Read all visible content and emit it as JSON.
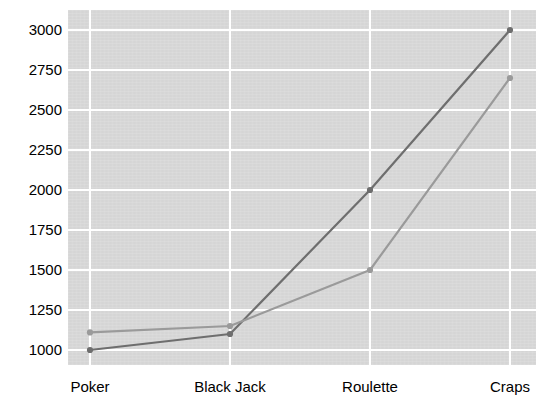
{
  "chart_data": {
    "type": "line",
    "title": "",
    "subtitle": "",
    "xlabel": "",
    "ylabel": "",
    "categories": [
      "Poker",
      "Black Jack",
      "Roulette",
      "Craps"
    ],
    "series": [
      {
        "name": "series-1",
        "color": "#6e6e6e",
        "values": [
          1000,
          1100,
          2000,
          3000
        ]
      },
      {
        "name": "series-2",
        "color": "#9a9a9a",
        "values": [
          1110,
          1150,
          1500,
          2700
        ]
      }
    ],
    "ylim": [
      1000,
      3000
    ],
    "yticks": [
      1000,
      1250,
      1500,
      1750,
      2000,
      2250,
      2500,
      2750,
      3000
    ],
    "ytick_labels": [
      "1000",
      "1250",
      "1500",
      "1750",
      "2000",
      "2250",
      "2500",
      "2750",
      "3000"
    ],
    "grid": true,
    "grid_color": "#ffffff",
    "plot_background": "#d9d9d9",
    "page_background": "#ffffff",
    "legend": false,
    "legend_position": "none",
    "markers": true,
    "axis_line": false
  }
}
